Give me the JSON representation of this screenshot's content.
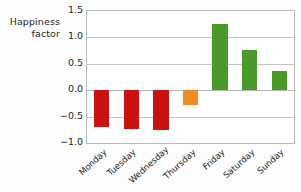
{
  "chart_data": {
    "type": "bar",
    "title": "",
    "xlabel": "",
    "ylabel": "Happiness factor",
    "categories": [
      "Monday",
      "Tuesday",
      "Wednesday",
      "Thursday",
      "Friday",
      "Saturday",
      "Sunday"
    ],
    "values": [
      -0.7,
      -0.74,
      -0.76,
      -0.29,
      1.26,
      0.76,
      0.36
    ],
    "bar_colors": [
      "#cc1111",
      "#cc1111",
      "#cc1111",
      "#f08a22",
      "#4a9a2a",
      "#4a9a2a",
      "#4a9a2a"
    ],
    "ylim": [
      -1.0,
      1.5
    ],
    "yticks": [
      1.5,
      1.0,
      0.5,
      0.0,
      -0.5,
      -1.0
    ],
    "ytick_labels": [
      "1.5",
      "1.0",
      "0.5",
      "0.0",
      "−0.5",
      "−1.0"
    ],
    "grid": true,
    "legend": "none"
  },
  "axis": {
    "y_title_line1": "Happiness",
    "y_title_line2": "factor"
  },
  "colors": {
    "negative": "#cc1111",
    "neutral": "#f08a22",
    "positive": "#4a9a2a",
    "grid": "#c3c6c8",
    "frame": "#b9bcbe",
    "text": "#231f20"
  }
}
